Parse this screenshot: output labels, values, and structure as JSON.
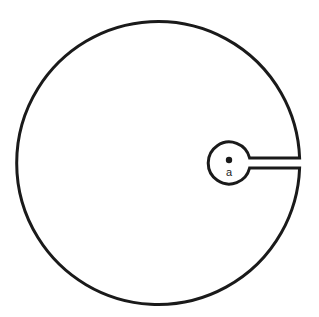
{
  "diagram": {
    "point_label": "a",
    "colors": {
      "stroke": "#1a1a1a",
      "background": "#ffffff"
    }
  }
}
